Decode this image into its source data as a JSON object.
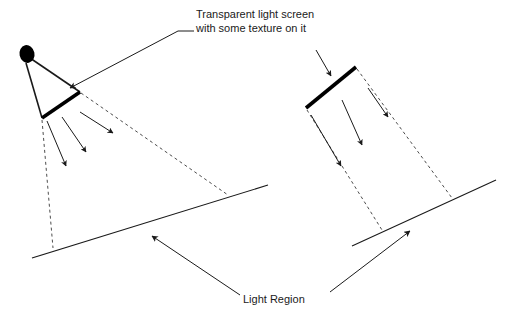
{
  "figure": {
    "background_color": "#ffffff",
    "stroke_color": "#1a1a1a",
    "thick_stroke_color": "#000000",
    "dash_color": "#555555"
  },
  "annotations": {
    "screen_callout": {
      "line1": "Transparent light screen",
      "line2": "with some texture on it"
    },
    "light_region": {
      "text": "Light Region"
    }
  },
  "left_diagram": {
    "name": "point-light-source-cone",
    "light_source": {
      "shape": "filled-ellipse",
      "cx": 27,
      "cy": 54,
      "rx": 7.5,
      "ry": 9,
      "color": "#000000"
    },
    "cone_edges": [
      {
        "name": "cone-edge-upper",
        "x1": 29,
        "y1": 59,
        "x2": 80,
        "y2": 92
      },
      {
        "name": "cone-edge-lower",
        "x1": 27,
        "y1": 63,
        "x2": 42,
        "y2": 118
      }
    ],
    "screen": {
      "name": "light-screen",
      "x1": 80,
      "y1": 92,
      "x2": 42,
      "y2": 118,
      "width": 3.5
    },
    "incoming_arrow": {
      "name": "incident-ray-arrow",
      "x1": 88,
      "y1": 79,
      "x2": 71,
      "y2": 89
    },
    "emitted_arrows": [
      {
        "x1": 47,
        "y1": 121,
        "x2": 66,
        "y2": 166
      },
      {
        "x1": 62,
        "y1": 117,
        "x2": 86,
        "y2": 152
      },
      {
        "x1": 80,
        "y1": 112,
        "x2": 113,
        "y2": 133
      }
    ],
    "dashed_bounds": [
      {
        "name": "light-region-bound-right",
        "x1": 81,
        "y1": 93,
        "x2": 228,
        "y2": 195
      },
      {
        "name": "light-region-bound-left",
        "x1": 42,
        "y1": 120,
        "x2": 53,
        "y2": 248
      }
    ],
    "ground_line": {
      "name": "ground-line-left",
      "x1": 32,
      "y1": 258,
      "x2": 268,
      "y2": 185
    }
  },
  "right_diagram": {
    "name": "directional-light-beam",
    "screen": {
      "name": "light-screen",
      "x1": 356,
      "y1": 67,
      "x2": 306,
      "y2": 108,
      "width": 3.5
    },
    "incoming_arrow": {
      "name": "incident-ray-arrow",
      "x1": 316,
      "y1": 50,
      "x2": 330,
      "y2": 75
    },
    "emitted_arrows": [
      {
        "x1": 311,
        "y1": 115,
        "x2": 341,
        "y2": 166
      },
      {
        "x1": 342,
        "y1": 100,
        "x2": 362,
        "y2": 145
      },
      {
        "x1": 368,
        "y1": 88,
        "x2": 388,
        "y2": 117
      }
    ],
    "dashed_bounds": [
      {
        "name": "beam-bound-right",
        "x1": 357,
        "y1": 69,
        "x2": 452,
        "y2": 198
      },
      {
        "name": "beam-bound-left",
        "x1": 307,
        "y1": 110,
        "x2": 382,
        "y2": 230
      }
    ],
    "ground_line": {
      "name": "ground-line-right",
      "x1": 352,
      "y1": 246,
      "x2": 496,
      "y2": 180
    }
  },
  "leaders": {
    "screen_callout_leader": {
      "name": "screen-callout-leader",
      "points": "194,31 178,31 70,88",
      "arrow_tip": {
        "x": 70,
        "y": 88
      }
    },
    "light_region_leader_left": {
      "name": "light-region-leader-left",
      "x1": 240,
      "y1": 295,
      "x2": 152,
      "y2": 236
    },
    "light_region_leader_right": {
      "name": "light-region-leader-right",
      "x1": 330,
      "y1": 292,
      "x2": 410,
      "y2": 231
    }
  },
  "text_positions": {
    "callout_line1": {
      "x": 196,
      "y": 18
    },
    "callout_line2": {
      "x": 196,
      "y": 32
    },
    "light_region": {
      "x": 283,
      "y": 303
    }
  }
}
